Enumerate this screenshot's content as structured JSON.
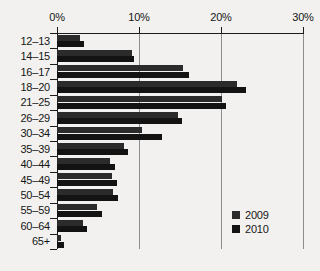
{
  "chart_data": {
    "type": "bar",
    "orientation": "horizontal",
    "title": "",
    "xlabel": "",
    "ylabel": "",
    "xlim": [
      0,
      30
    ],
    "xunit": "%",
    "xticks": [
      0,
      10,
      20,
      30
    ],
    "xtick_labels": [
      "0%",
      "10%",
      "20%",
      "30%"
    ],
    "grid": "vertical",
    "legend_position": "bottom-right",
    "categories": [
      "12–13",
      "14–15",
      "16–17",
      "18–20",
      "21–25",
      "26–29",
      "30–34",
      "35–39",
      "40–44",
      "45–49",
      "50–54",
      "55–59",
      "60–64",
      "65+"
    ],
    "series": [
      {
        "name": "2009",
        "color": "#2b2b2b",
        "values": [
          2.8,
          9.1,
          15.4,
          22.0,
          20.1,
          14.8,
          10.4,
          8.2,
          6.5,
          6.7,
          6.8,
          4.9,
          3.2,
          0.5
        ]
      },
      {
        "name": "2010",
        "color": "#131313",
        "values": [
          3.3,
          9.4,
          16.1,
          23.0,
          20.6,
          15.2,
          12.8,
          8.7,
          7.1,
          7.3,
          7.4,
          5.5,
          3.7,
          0.9
        ]
      }
    ]
  },
  "legend": {
    "items": [
      {
        "label": "2009",
        "color": "#2b2b2b"
      },
      {
        "label": "2010",
        "color": "#131313"
      }
    ]
  },
  "colors": {
    "background": "#f2f1ef",
    "axis": "#1b1b1b",
    "grid": "#8d8d8d",
    "text": "#161616"
  }
}
